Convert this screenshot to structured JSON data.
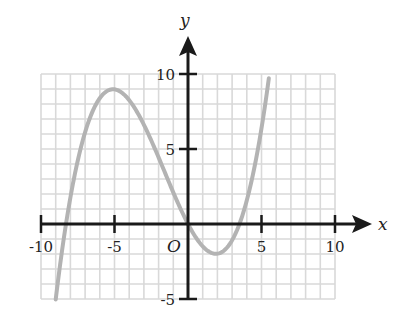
{
  "chart_data": {
    "type": "line",
    "title": "",
    "xlabel": "x",
    "ylabel": "y",
    "origin_label": "O",
    "xlim": [
      -10,
      10
    ],
    "ylim": [
      -5,
      10
    ],
    "grid": true,
    "grid_step": 1,
    "x_ticks": [
      -10,
      -5,
      5,
      10
    ],
    "x_tick_labels": [
      "-10",
      "-5",
      "5",
      "10"
    ],
    "y_ticks": [
      10,
      5,
      -5
    ],
    "y_tick_labels": [
      "10",
      "5",
      "-5"
    ],
    "series": [
      {
        "name": "f(x)",
        "description": "cubic curve through origin",
        "color": "#b3b3b3",
        "x": [
          -9,
          -8.3,
          -7,
          -6,
          -5,
          -4,
          -3,
          -2,
          -1,
          0,
          1,
          2,
          3,
          3.5,
          4,
          5,
          5.5
        ],
        "y": [
          -5.0,
          0,
          5.1,
          8.1,
          9.0,
          8.5,
          7.0,
          4.8,
          2.4,
          0,
          -1.8,
          -2.0,
          -1.1,
          0,
          1.6,
          6.6,
          9.7
        ]
      }
    ],
    "key_points": {
      "local_max": [
        -5,
        9
      ],
      "local_min": [
        2,
        -2
      ],
      "x_intercepts": [
        -8.3,
        0,
        3.5
      ],
      "y_intercept": 0
    }
  },
  "colors": {
    "axis": "#1a1a1a",
    "grid": "#d9d9d9",
    "curve": "#b3b3b3",
    "background": "#ffffff"
  }
}
